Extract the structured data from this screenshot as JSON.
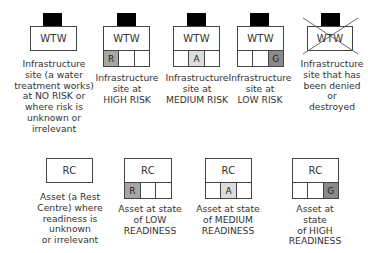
{
  "infrastructure": {
    "items": [
      {
        "label": "WTW",
        "status": "no-risk",
        "cells": [],
        "caption": "Infrastructure\nsite (a water\ntreatment works)\nat NO RISK or\nwhere risk is\nunknown or\nirrelevant"
      },
      {
        "label": "WTW",
        "status": "high-risk",
        "cells": [
          {
            "text": "R",
            "fill": "#a6a6a6"
          },
          {
            "text": "",
            "fill": "#ffffff"
          },
          {
            "text": "",
            "fill": "#ffffff"
          }
        ],
        "caption": "Infrastructure\nsite at\nHIGH RISK"
      },
      {
        "label": "WTW",
        "status": "medium-risk",
        "cells": [
          {
            "text": "",
            "fill": "#ffffff"
          },
          {
            "text": "A",
            "fill": "#dcdcdc"
          },
          {
            "text": "",
            "fill": "#ffffff"
          }
        ],
        "caption": "Infrastructure\nsite at\nMEDIUM RISK"
      },
      {
        "label": "WTW",
        "status": "low-risk",
        "cells": [
          {
            "text": "",
            "fill": "#ffffff"
          },
          {
            "text": "",
            "fill": "#ffffff"
          },
          {
            "text": "G",
            "fill": "#8a8a8a"
          }
        ],
        "caption": "Infrastructure\nsite at\nLOW RISK"
      },
      {
        "label": "WTW",
        "status": "denied-or-destroyed",
        "cells": [],
        "caption": "Infrastructure\nsite that has\nbeen denied or\ndestroyed"
      }
    ]
  },
  "assets": {
    "items": [
      {
        "label": "RC",
        "status": "unknown",
        "cells": [],
        "caption": "Asset (a Rest\nCentre) where\nreadiness is\nunknown\nor irrelevant"
      },
      {
        "label": "RC",
        "status": "low-readiness",
        "cells": [
          {
            "text": "R",
            "fill": "#a6a6a6"
          },
          {
            "text": "",
            "fill": "#ffffff"
          },
          {
            "text": "",
            "fill": "#ffffff"
          }
        ],
        "caption": "Asset at state\nof LOW\nREADINESS"
      },
      {
        "label": "RC",
        "status": "medium-readiness",
        "cells": [
          {
            "text": "",
            "fill": "#ffffff"
          },
          {
            "text": "A",
            "fill": "#dcdcdc"
          },
          {
            "text": "",
            "fill": "#ffffff"
          }
        ],
        "caption": "Asset at state\nof MEDIUM\nREADINESS"
      },
      {
        "label": "RC",
        "status": "high-readiness",
        "cells": [
          {
            "text": "",
            "fill": "#ffffff"
          },
          {
            "text": "",
            "fill": "#ffffff"
          },
          {
            "text": "G",
            "fill": "#8a8a8a"
          }
        ],
        "caption": "Asset at state\nof HIGH\nREADINESS"
      }
    ]
  }
}
